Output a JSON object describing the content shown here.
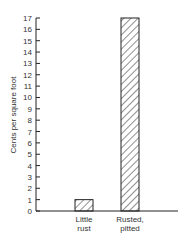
{
  "chart_data": {
    "type": "bar",
    "title": "",
    "xlabel": "",
    "ylabel": "Cents per square foot",
    "categories": [
      "Little rust",
      "Rusted, pitted"
    ],
    "category_lines": [
      [
        "Little",
        "rust"
      ],
      [
        "Rusted,",
        "pitted"
      ]
    ],
    "values": [
      1,
      17
    ],
    "ylim": [
      0,
      17
    ],
    "yticks": [
      0,
      1,
      2,
      3,
      4,
      5,
      6,
      7,
      8,
      9,
      10,
      11,
      12,
      13,
      14,
      15,
      16,
      17
    ],
    "grid": false,
    "bar_fill": "hatched",
    "legend": null
  }
}
